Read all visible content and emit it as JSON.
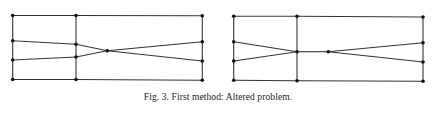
{
  "figure": {
    "caption": "Fig. 3.  First method: Altered problem.",
    "line_color": "#333333",
    "node_color": "#111111",
    "panels": [
      {
        "name": "left-mesh",
        "nodes": {
          "a1": [
            12.7,
            15.5
          ],
          "a2": [
            12.7,
            40.7
          ],
          "a3": [
            12.7,
            60.0
          ],
          "a4": [
            12.7,
            79.5
          ],
          "b1": [
            76.0,
            15.5
          ],
          "b2": [
            76.0,
            44.3
          ],
          "b3": [
            76.0,
            57.0
          ],
          "b4": [
            76.0,
            79.5
          ],
          "c": [
            107.3,
            50.7
          ],
          "d1": [
            202.3,
            15.7
          ],
          "d2": [
            202.3,
            41.7
          ],
          "d3": [
            202.3,
            61.0
          ],
          "d4": [
            202.3,
            80.3
          ]
        },
        "edges": [
          [
            "a1",
            "b1"
          ],
          [
            "b1",
            "d1"
          ],
          [
            "a4",
            "b4"
          ],
          [
            "b4",
            "d4"
          ],
          [
            "a1",
            "a2"
          ],
          [
            "a2",
            "a3"
          ],
          [
            "a3",
            "a4"
          ],
          [
            "b1",
            "b2"
          ],
          [
            "b2",
            "b3"
          ],
          [
            "b3",
            "b4"
          ],
          [
            "d1",
            "d2"
          ],
          [
            "d2",
            "d3"
          ],
          [
            "d3",
            "d4"
          ],
          [
            "a2",
            "b2"
          ],
          [
            "a3",
            "b3"
          ],
          [
            "b2",
            "c"
          ],
          [
            "b3",
            "c"
          ],
          [
            "c",
            "d2"
          ],
          [
            "c",
            "d3"
          ]
        ]
      },
      {
        "name": "right-mesh",
        "nodes": {
          "a1": [
            233.7,
            16.3
          ],
          "a2": [
            233.7,
            41.7
          ],
          "a3": [
            233.7,
            61.0
          ],
          "a4": [
            233.7,
            80.3
          ],
          "b1": [
            297.0,
            16.3
          ],
          "b2": [
            297.0,
            51.7
          ],
          "b4": [
            297.0,
            80.7
          ],
          "c": [
            328.3,
            51.7
          ],
          "d1": [
            423.0,
            17.0
          ],
          "d2": [
            423.0,
            42.7
          ],
          "d3": [
            423.0,
            62.0
          ],
          "d4": [
            423.0,
            81.3
          ]
        },
        "edges": [
          [
            "a1",
            "b1"
          ],
          [
            "b1",
            "d1"
          ],
          [
            "a4",
            "b4"
          ],
          [
            "b4",
            "d4"
          ],
          [
            "a1",
            "a2"
          ],
          [
            "a2",
            "a3"
          ],
          [
            "a3",
            "a4"
          ],
          [
            "b1",
            "b2"
          ],
          [
            "b2",
            "b4"
          ],
          [
            "d1",
            "d2"
          ],
          [
            "d2",
            "d3"
          ],
          [
            "d3",
            "d4"
          ],
          [
            "a2",
            "b2"
          ],
          [
            "a3",
            "b2"
          ],
          [
            "b2",
            "c"
          ],
          [
            "c",
            "d2"
          ],
          [
            "c",
            "d3"
          ]
        ]
      }
    ]
  }
}
